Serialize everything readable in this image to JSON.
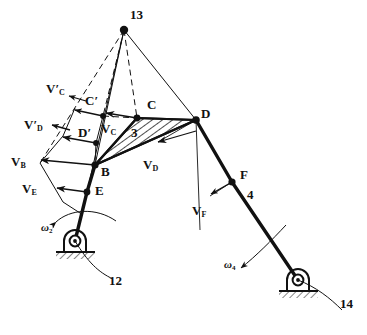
{
  "figure": {
    "type": "kinematic-linkage-velocity-diagram"
  },
  "labels": {
    "instant_center": "13",
    "ground_left": "12",
    "ground_right": "14",
    "link_ternary": "3",
    "link_output": "4",
    "point_b": "B",
    "point_c": "C",
    "point_c_prime": "C′",
    "point_d": "D",
    "point_d_prime": "D′",
    "point_e": "E",
    "point_f": "F"
  },
  "velocities": {
    "vb": {
      "sym": "V",
      "sub": "B",
      "prime": ""
    },
    "ve": {
      "sym": "V",
      "sub": "E",
      "prime": ""
    },
    "vc": {
      "sym": "V",
      "sub": "C",
      "prime": ""
    },
    "vd": {
      "sym": "V",
      "sub": "D",
      "prime": ""
    },
    "vf": {
      "sym": "V",
      "sub": "F",
      "prime": ""
    },
    "vc_prime": {
      "sym": "V",
      "sub": "C",
      "prime": "′"
    },
    "vd_prime": {
      "sym": "V",
      "sub": "D",
      "prime": "′"
    }
  },
  "angular": {
    "omega2": {
      "sym": "ω",
      "sub": "2"
    },
    "omega4": {
      "sym": "ω",
      "sub": "4"
    }
  },
  "colors": {
    "ink": "#111111",
    "paper": "#ffffff"
  }
}
